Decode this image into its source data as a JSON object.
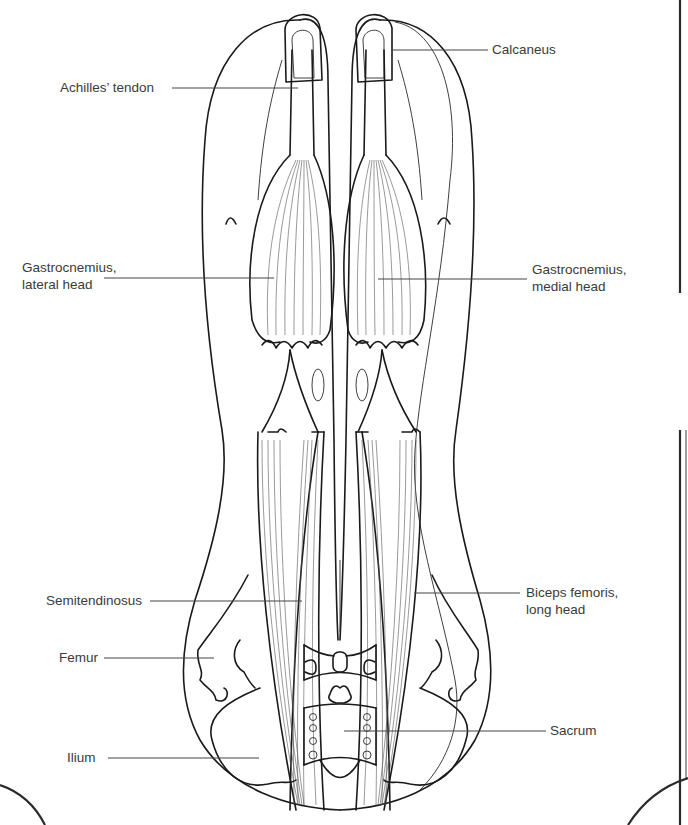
{
  "figure": {
    "line_color": "#1a1a1a",
    "label_color": "#3a3a3a",
    "background": "#ffffff"
  },
  "labels": {
    "achilles": {
      "text": "Achilles’ tendon"
    },
    "calcaneus": {
      "text": "Calcaneus"
    },
    "gastro_lateral": {
      "text": "Gastrocnemius,\nlateral head"
    },
    "gastro_medial": {
      "text": "Gastrocnemius,\nmedial head"
    },
    "semitendinosus": {
      "text": "Semitendinosus"
    },
    "biceps_femoris": {
      "text": "Biceps femoris,\nlong head"
    },
    "femur": {
      "text": "Femur"
    },
    "sacrum": {
      "text": "Sacrum"
    },
    "ilium": {
      "text": "Ilium"
    }
  }
}
